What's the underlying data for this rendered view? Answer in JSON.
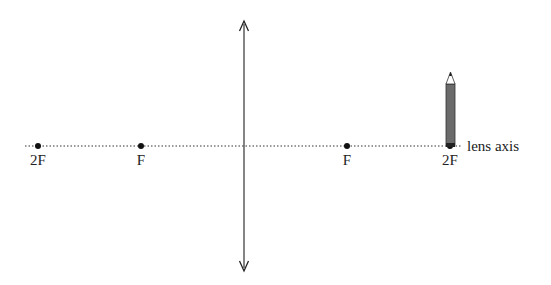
{
  "diagram": {
    "type": "converging-lens-ray-diagram",
    "axis_label": "lens axis",
    "points": [
      {
        "id": "2F-left",
        "label": "2F",
        "x": 38
      },
      {
        "id": "F-left",
        "label": "F",
        "x": 141
      },
      {
        "id": "F-right",
        "label": "F",
        "x": 347
      },
      {
        "id": "2F-right",
        "label": "2F",
        "x": 450
      }
    ],
    "lens": {
      "x": 244,
      "top": 20,
      "bottom": 270
    },
    "object": {
      "name": "pencil",
      "position": "2F-right",
      "color": "#6b6b6b"
    },
    "colors": {
      "line": "#222222",
      "pencil_body": "#6b6b6b"
    }
  }
}
